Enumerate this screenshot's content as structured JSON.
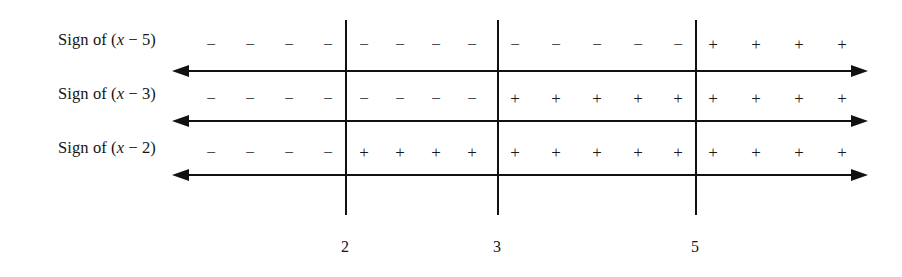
{
  "diagram": {
    "type": "sign-chart",
    "line_color": "#111111",
    "background_color": "#ffffff",
    "critical_values": [
      {
        "label": "2",
        "x": 345
      },
      {
        "label": "3",
        "x": 497
      },
      {
        "label": "5",
        "x": 695
      }
    ],
    "axis_start_x": 172,
    "axis_end_x": 868,
    "rows": [
      {
        "id": "row-x-minus-5",
        "label_prefix": "Sign of (",
        "label_variable": "x",
        "label_suffix": " − 5)",
        "label_full": "Sign of (x − 5)",
        "expression": "x - 5",
        "axis_y": 70,
        "sign_y": 36,
        "intervals": [
          {
            "range": "(-∞, 2)",
            "sign": "−",
            "count": 4
          },
          {
            "range": "(2, 3)",
            "sign": "−",
            "count": 4
          },
          {
            "range": "(3, 5)",
            "sign": "−",
            "count": 5
          },
          {
            "range": "(5, ∞)",
            "sign": "+",
            "count": 4
          }
        ],
        "signs": [
          {
            "sign": "−",
            "x": 211
          },
          {
            "sign": "−",
            "x": 250
          },
          {
            "sign": "−",
            "x": 289
          },
          {
            "sign": "−",
            "x": 328
          },
          {
            "sign": "−",
            "x": 364
          },
          {
            "sign": "−",
            "x": 400
          },
          {
            "sign": "−",
            "x": 436
          },
          {
            "sign": "−",
            "x": 472
          },
          {
            "sign": "−",
            "x": 515
          },
          {
            "sign": "−",
            "x": 556
          },
          {
            "sign": "−",
            "x": 597
          },
          {
            "sign": "−",
            "x": 638
          },
          {
            "sign": "−",
            "x": 678
          },
          {
            "sign": "+",
            "x": 713
          },
          {
            "sign": "+",
            "x": 756
          },
          {
            "sign": "+",
            "x": 799
          },
          {
            "sign": "+",
            "x": 842
          }
        ]
      },
      {
        "id": "row-x-minus-3",
        "label_prefix": "Sign of (",
        "label_variable": "x",
        "label_suffix": " − 3)",
        "label_full": "Sign of (x − 3)",
        "expression": "x - 3",
        "axis_y": 120,
        "sign_y": 90,
        "intervals": [
          {
            "range": "(-∞, 2)",
            "sign": "−",
            "count": 4
          },
          {
            "range": "(2, 3)",
            "sign": "−",
            "count": 4
          },
          {
            "range": "(3, 5)",
            "sign": "+",
            "count": 5
          },
          {
            "range": "(5, ∞)",
            "sign": "+",
            "count": 4
          }
        ],
        "signs": [
          {
            "sign": "−",
            "x": 211
          },
          {
            "sign": "−",
            "x": 250
          },
          {
            "sign": "−",
            "x": 289
          },
          {
            "sign": "−",
            "x": 328
          },
          {
            "sign": "−",
            "x": 364
          },
          {
            "sign": "−",
            "x": 400
          },
          {
            "sign": "−",
            "x": 436
          },
          {
            "sign": "−",
            "x": 472
          },
          {
            "sign": "+",
            "x": 515
          },
          {
            "sign": "+",
            "x": 556
          },
          {
            "sign": "+",
            "x": 597
          },
          {
            "sign": "+",
            "x": 638
          },
          {
            "sign": "+",
            "x": 678
          },
          {
            "sign": "+",
            "x": 713
          },
          {
            "sign": "+",
            "x": 756
          },
          {
            "sign": "+",
            "x": 799
          },
          {
            "sign": "+",
            "x": 842
          }
        ]
      },
      {
        "id": "row-x-minus-2",
        "label_prefix": "Sign of (",
        "label_variable": "x",
        "label_suffix": " − 2)",
        "label_full": "Sign of (x − 2)",
        "expression": "x - 2",
        "axis_y": 174,
        "sign_y": 144,
        "intervals": [
          {
            "range": "(-∞, 2)",
            "sign": "−",
            "count": 4
          },
          {
            "range": "(2, 3)",
            "sign": "+",
            "count": 4
          },
          {
            "range": "(3, 5)",
            "sign": "+",
            "count": 5
          },
          {
            "range": "(5, ∞)",
            "sign": "+",
            "count": 4
          }
        ],
        "signs": [
          {
            "sign": "−",
            "x": 211
          },
          {
            "sign": "−",
            "x": 250
          },
          {
            "sign": "−",
            "x": 289
          },
          {
            "sign": "−",
            "x": 328
          },
          {
            "sign": "+",
            "x": 364
          },
          {
            "sign": "+",
            "x": 400
          },
          {
            "sign": "+",
            "x": 436
          },
          {
            "sign": "+",
            "x": 472
          },
          {
            "sign": "+",
            "x": 515
          },
          {
            "sign": "+",
            "x": 556
          },
          {
            "sign": "+",
            "x": 597
          },
          {
            "sign": "+",
            "x": 638
          },
          {
            "sign": "+",
            "x": 678
          },
          {
            "sign": "+",
            "x": 713
          },
          {
            "sign": "+",
            "x": 756
          },
          {
            "sign": "+",
            "x": 799
          },
          {
            "sign": "+",
            "x": 842
          }
        ]
      }
    ],
    "labels": {
      "label_x": 58,
      "row1_label_y": 30,
      "row2_label_y": 84,
      "row3_label_y": 138
    },
    "tick_label_y": 238,
    "divider_top": 20,
    "divider_bottom": 215
  }
}
